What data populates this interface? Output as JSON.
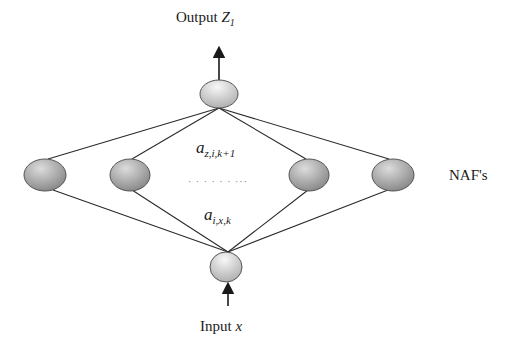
{
  "diagram": {
    "type": "neural-network",
    "labels": {
      "output": "Output",
      "output_var": "Z",
      "output_sub": "1",
      "input": "Input",
      "input_var": "x",
      "layer": "NAF's",
      "upper_weight_base": "a",
      "upper_weight_sub": "z,i,k+1",
      "lower_weight_base": "a",
      "lower_weight_sub": "i,x,k",
      "ellipsis": "· · · · · · ···"
    },
    "nodes": {
      "output": {
        "cx": 219,
        "cy": 94,
        "rx": 19,
        "ry": 14
      },
      "hidden": [
        {
          "cx": 45,
          "cy": 175,
          "rx": 21,
          "ry": 16
        },
        {
          "cx": 130,
          "cy": 175,
          "rx": 20,
          "ry": 16
        },
        {
          "cx": 309,
          "cy": 175,
          "rx": 20,
          "ry": 16
        },
        {
          "cx": 393,
          "cy": 175,
          "rx": 21,
          "ry": 16
        }
      ],
      "input": {
        "cx": 226,
        "cy": 267,
        "rx": 16,
        "ry": 15
      }
    },
    "colors": {
      "edge": "#2b2b2b",
      "node_stroke": "#555555",
      "hidden_fill_light": "#d6d6d6",
      "hidden_fill_dark": "#8a8a8a",
      "io_fill_light": "#f4f4f4",
      "io_fill_dark": "#b3b3b3"
    }
  }
}
